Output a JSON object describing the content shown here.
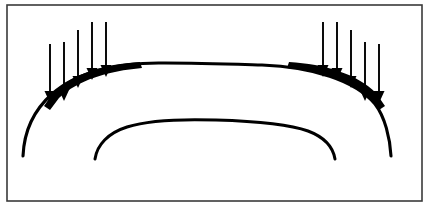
{
  "figure": {
    "background_color": "#ffffff",
    "ink_color": "#000000",
    "frame_color": "#3a3a3a",
    "canvas": {
      "width": 430,
      "height": 210
    }
  },
  "frame": {
    "name": "border-rectangle",
    "x": 7,
    "y": 5,
    "width": 415,
    "height": 196,
    "stroke_width": 1.6
  },
  "curves": [
    {
      "id": "outer-shell",
      "label": "Outer arch profile",
      "stroke_width": 3.1,
      "left_end": {
        "x": 23,
        "y": 156
      },
      "apex": {
        "x": 214,
        "y": 64
      },
      "right_end": {
        "x": 391,
        "y": 156
      },
      "path": "M 23 156 C 24 132 34 110 52 94 C 76 72 118 62 165 63 C 198 63 228 64 262 65 C 312 67 355 80 375 104 C 385 117 390 138 391 156"
    },
    {
      "id": "inner-shell",
      "label": "Inner arch profile",
      "stroke_width": 3.0,
      "left_end": {
        "x": 95,
        "y": 159
      },
      "apex": {
        "x": 214,
        "y": 121
      },
      "right_end": {
        "x": 335,
        "y": 159
      },
      "path": "M 95 159 C 97 145 108 133 127 127 C 152 119 186 119 216 120 C 250 121 286 123 308 131 C 324 137 333 147 335 159"
    }
  ],
  "haunch_shading": [
    {
      "id": "left-haunch-wedge",
      "label": "Thickened left haunch under load",
      "path": "M 44 106 L 53 93 C 72 74 104 64 140 62 L 142 68 C 108 71 78 80 59 98 L 50 110 Z"
    },
    {
      "id": "right-haunch-wedge",
      "label": "Thickened right haunch under load",
      "path": "M 385 106 L 376 93 C 357 74 325 64 289 62 L 287 68 C 321 71 351 80 370 98 L 379 110 Z"
    }
  ],
  "load_arrows": {
    "label": "Vertical downward distributed loads",
    "direction": "down",
    "shaft_width": 1.9,
    "head_width": 11,
    "head_height": 12,
    "left_group": {
      "id": "left-load-group",
      "count": 5,
      "arrows": [
        {
          "id": "left-arrow-1",
          "x": 50,
          "top": 44,
          "tip": 103
        },
        {
          "id": "left-arrow-2",
          "x": 64,
          "top": 42,
          "tip": 101
        },
        {
          "id": "left-arrow-3",
          "x": 78,
          "top": 30,
          "tip": 88
        },
        {
          "id": "left-arrow-4",
          "x": 92,
          "top": 22,
          "tip": 80
        },
        {
          "id": "left-arrow-5",
          "x": 106,
          "top": 22,
          "tip": 77
        }
      ]
    },
    "right_group": {
      "id": "right-load-group",
      "count": 5,
      "arrows": [
        {
          "id": "right-arrow-1",
          "x": 323,
          "top": 22,
          "tip": 77
        },
        {
          "id": "right-arrow-2",
          "x": 337,
          "top": 22,
          "tip": 80
        },
        {
          "id": "right-arrow-3",
          "x": 351,
          "top": 30,
          "tip": 88
        },
        {
          "id": "right-arrow-4",
          "x": 365,
          "top": 42,
          "tip": 101
        },
        {
          "id": "right-arrow-5",
          "x": 379,
          "top": 44,
          "tip": 103
        }
      ]
    }
  }
}
